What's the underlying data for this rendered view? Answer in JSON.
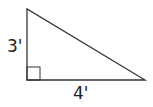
{
  "diagram": {
    "type": "right-triangle",
    "labels": {
      "vertical_leg": "3'",
      "horizontal_leg": "4'"
    },
    "vertices": {
      "top": [
        27,
        9
      ],
      "right_angle": [
        27,
        80
      ],
      "bottom_right": [
        145,
        80
      ]
    },
    "colors": {
      "stroke": "#333333",
      "text": "#222222"
    }
  }
}
